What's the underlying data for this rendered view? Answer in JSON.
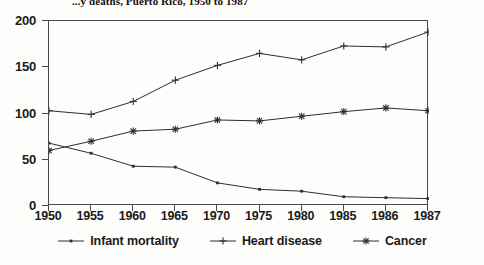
{
  "chart_data": {
    "type": "line",
    "title": "...y deaths, Puerto Rico, 1950 to 1987",
    "xlabel": "",
    "ylabel": "",
    "categories": [
      "1950",
      "1955",
      "1960",
      "1965",
      "1970",
      "1975",
      "1980",
      "1985",
      "1986",
      "1987"
    ],
    "ylim": [
      0,
      200
    ],
    "yticks": [
      0,
      50,
      100,
      150,
      200
    ],
    "grid": false,
    "legend_position": "bottom",
    "series": [
      {
        "name": "Infant mortality",
        "marker": "dot",
        "values": [
          68,
          57,
          43,
          42,
          25,
          18,
          16,
          10,
          9,
          8
        ]
      },
      {
        "name": "Heart disease",
        "marker": "plus",
        "values": [
          103,
          99,
          113,
          136,
          152,
          165,
          158,
          173,
          172,
          188
        ]
      },
      {
        "name": "Cancer",
        "marker": "asterisk",
        "values": [
          60,
          70,
          81,
          83,
          93,
          92,
          97,
          102,
          106,
          103
        ]
      }
    ]
  },
  "style": {
    "line_color": "#2e2e2e",
    "axis_color": "#4a4a4a",
    "background": "#fdfdfb"
  }
}
